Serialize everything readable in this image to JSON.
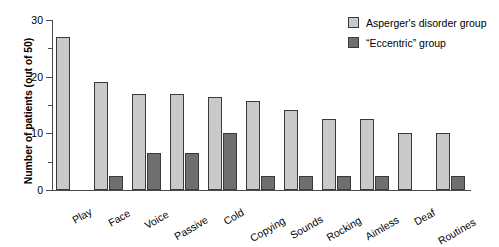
{
  "chart_data": {
    "type": "bar",
    "title": "",
    "xlabel": "",
    "ylabel": "Number of patients (out of 50)",
    "ylim": [
      0,
      30
    ],
    "yticks": [
      0,
      10,
      20,
      30
    ],
    "yticks_minor": [
      5,
      15,
      25
    ],
    "grid": false,
    "legend_position": "top-right",
    "categories": [
      "Play",
      "Face",
      "Voice",
      "Passive",
      "Cold",
      "Copying",
      "Sounds",
      "Rocking",
      "Aimless",
      "Deaf",
      "Routines"
    ],
    "series": [
      {
        "name": "Asperger's disorder group",
        "color": "#c9c9c9",
        "values": [
          27,
          19,
          17,
          17,
          16.5,
          15.7,
          14.2,
          12.6,
          12.6,
          10,
          10
        ]
      },
      {
        "name": "“Eccentric” group",
        "color": "#6f6f6f",
        "values": [
          0,
          2.4,
          6.5,
          6.5,
          10,
          2.4,
          2.4,
          2.4,
          2.4,
          0,
          2.4
        ]
      }
    ]
  },
  "legend": {
    "items": [
      {
        "label": "Asperger's disorder group",
        "swatch": "light"
      },
      {
        "label": "“Eccentric” group",
        "swatch": "dark"
      }
    ]
  },
  "axes": {
    "y_title": "Number of patients (out of 50)",
    "y_tick_labels": [
      "0",
      "10",
      "20",
      "30"
    ]
  }
}
